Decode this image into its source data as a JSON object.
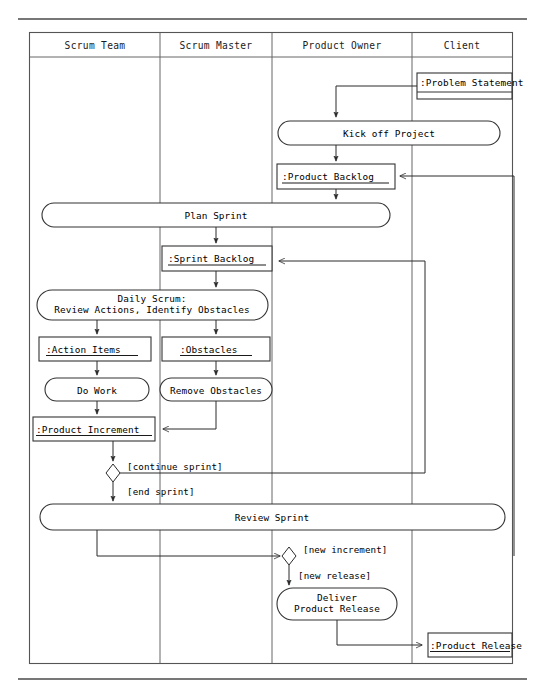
{
  "diagram": {
    "type": "uml-activity-swimlane",
    "colors": {
      "background": "#ffffff",
      "line": "#2b2b2b",
      "frame": "#555555",
      "text": "#000000"
    },
    "lanes": [
      {
        "id": "scrum-team",
        "label": "Scrum Team"
      },
      {
        "id": "scrum-master",
        "label": "Scrum Master"
      },
      {
        "id": "product-owner",
        "label": "Product Owner"
      },
      {
        "id": "client",
        "label": "Client"
      }
    ],
    "activities": [
      {
        "id": "kick-off-project",
        "label": "Kick off Project",
        "lane": "product-owner"
      },
      {
        "id": "plan-sprint",
        "label": "Plan Sprint",
        "lane": "scrum-team"
      },
      {
        "id": "daily-scrum",
        "label_line1": "Daily Scrum:",
        "label_line2": "Review Actions, Identify Obstacles",
        "lane": "scrum-team"
      },
      {
        "id": "do-work",
        "label": "Do Work",
        "lane": "scrum-team"
      },
      {
        "id": "remove-obstacles",
        "label": "Remove Obstacles",
        "lane": "scrum-master"
      },
      {
        "id": "review-sprint",
        "label": "Review Sprint",
        "lane": "scrum-team"
      },
      {
        "id": "deliver-product-release",
        "label_line1": "Deliver",
        "label_line2": "Product Release",
        "lane": "product-owner"
      }
    ],
    "objects": [
      {
        "id": "problem-statement",
        "label": ":Problem Statement",
        "lane": "client",
        "underlined": false
      },
      {
        "id": "product-backlog",
        "label": ":Product Backlog",
        "lane": "product-owner",
        "underlined": true
      },
      {
        "id": "sprint-backlog",
        "label": ":Sprint Backlog",
        "lane": "scrum-master",
        "underlined": true
      },
      {
        "id": "action-items",
        "label": ":Action Items",
        "lane": "scrum-team",
        "underlined": true
      },
      {
        "id": "obstacles",
        "label": ":Obstacles",
        "lane": "scrum-master",
        "underlined": true
      },
      {
        "id": "product-increment",
        "label": ":Product Increment",
        "lane": "scrum-team",
        "underlined": true
      },
      {
        "id": "product-release",
        "label": ":Product Release",
        "lane": "client",
        "underlined": true
      }
    ],
    "guards": [
      {
        "id": "continue-sprint",
        "label": "[continue sprint]"
      },
      {
        "id": "end-sprint",
        "label": "[end sprint]"
      },
      {
        "id": "new-increment",
        "label": "[new increment]"
      },
      {
        "id": "new-release",
        "label": "[new release]"
      }
    ]
  }
}
